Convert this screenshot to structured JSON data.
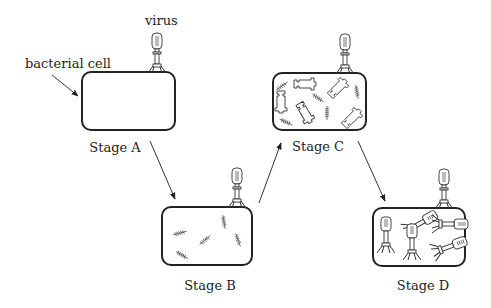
{
  "labels": {
    "virus": "virus",
    "bacterial_cell": "bacterial cell"
  },
  "stages": [
    {
      "id": "A",
      "label": "Stage A",
      "contents": "empty"
    },
    {
      "id": "B",
      "label": "Stage B",
      "contents": "viral DNA fragments"
    },
    {
      "id": "C",
      "label": "Stage C",
      "contents": "viral DNA and protein parts"
    },
    {
      "id": "D",
      "label": "Stage D",
      "contents": "assembled viruses"
    }
  ],
  "arrows": [
    {
      "from": "A",
      "to": "B"
    },
    {
      "from": "B",
      "to": "C"
    },
    {
      "from": "C",
      "to": "D"
    }
  ],
  "colors": {
    "stroke": "#222222",
    "background": "#ffffff"
  }
}
